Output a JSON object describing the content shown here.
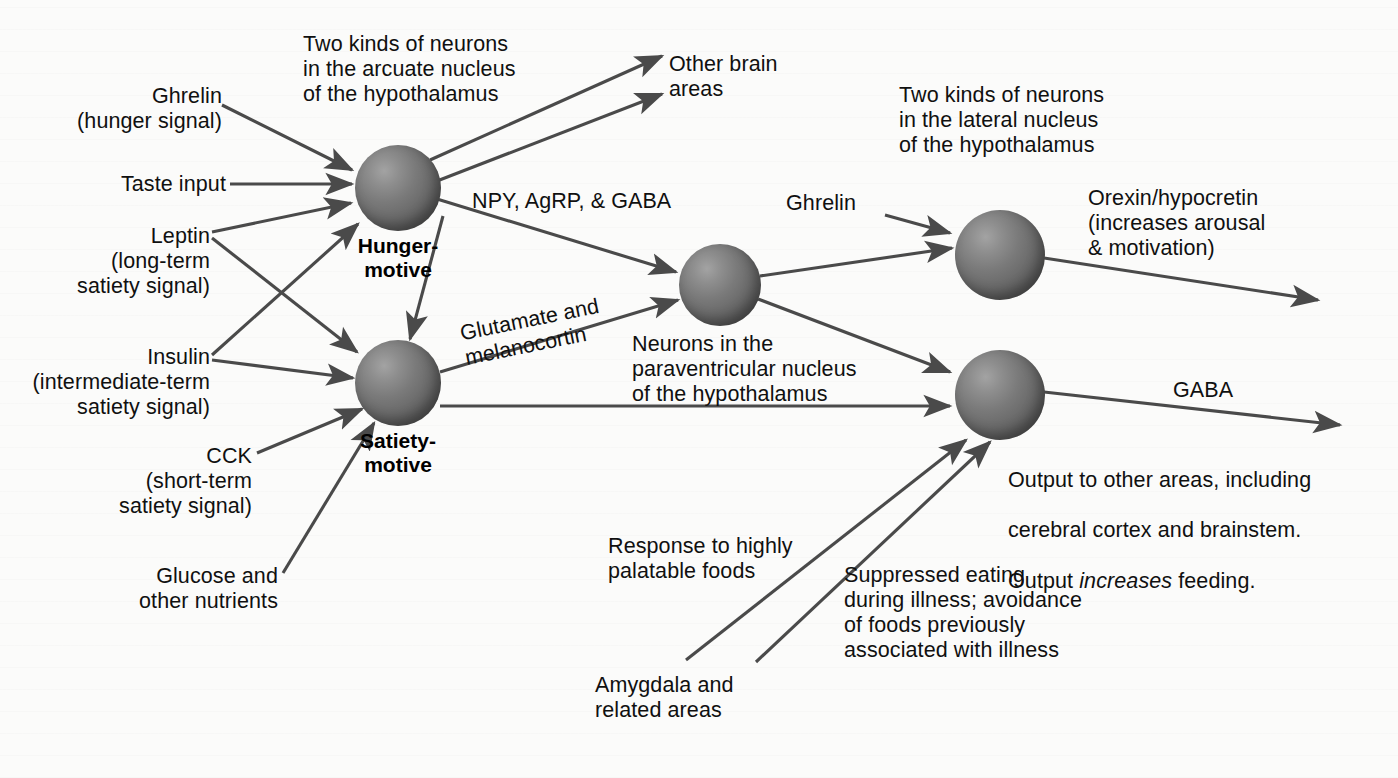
{
  "figure": {
    "background_color": "#fbfbfa",
    "ink_color": "#4a4a4a",
    "text_color": "#101010"
  },
  "inputs": {
    "ghrelin_left": "Ghrelin\n(hunger signal)",
    "taste_input": "Taste input",
    "leptin": "Leptin\n(long-term\nsatiety signal)",
    "insulin": "Insulin\n(intermediate-term\nsatiety signal)",
    "cck": "CCK\n(short-term\nsatiety signal)",
    "glucose": "Glucose and\nother nutrients",
    "ghrelin_right": "Ghrelin",
    "amygdala": "Amygdala and\nrelated areas"
  },
  "nodes": {
    "hunger": "Hunger-\nmotive",
    "satiety": "Satiety-\nmotive"
  },
  "annotations": {
    "arcuate": "Two kinds of neurons\nin the arcuate nucleus\nof the hypothalamus",
    "lateral": "Two kinds of neurons\nin the lateral nucleus\nof the hypothalamus",
    "paraventricular": "Neurons in the\nparaventricular nucleus\nof the hypothalamus",
    "other_brain_areas": "Other brain\nareas",
    "npy": "NPY, AgRP, & GABA",
    "glutamate": "Glutamate and\nmelanocortin",
    "orexin": "Orexin/hypocretin\n(increases arousal\n& motivation)",
    "gaba": "GABA",
    "output_line1": "Output to other areas, including",
    "output_line2": "cerebral cortex and brainstem.",
    "output_line3_a": "Output ",
    "output_line3_em": "increases",
    "output_line3_b": " feeding.",
    "palatable": "Response to highly\npalatable foods",
    "illness": "Suppressed eating\nduring illness; avoidance\nof foods previously\nassociated with illness"
  }
}
